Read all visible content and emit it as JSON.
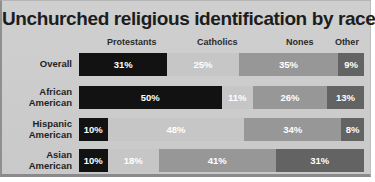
{
  "chart_data": {
    "type": "bar",
    "orientation": "horizontal-stacked",
    "title": "Unchurched religious identification by race",
    "xlabel": "",
    "ylabel": "",
    "xlim": [
      0,
      100
    ],
    "grid": false,
    "legend_position": "top",
    "value_suffix": "%",
    "categories": [
      "Overall",
      "African American",
      "Hispanic American",
      "Asian American"
    ],
    "series": [
      {
        "name": "Protestants",
        "color": "#121212",
        "values": [
          31,
          50,
          10,
          10
        ]
      },
      {
        "name": "Catholics",
        "color": "#c6c6c6",
        "values": [
          25,
          11,
          48,
          18
        ]
      },
      {
        "name": "Nones",
        "color": "#979797",
        "values": [
          35,
          26,
          34,
          41
        ]
      },
      {
        "name": "Other",
        "color": "#636363",
        "values": [
          9,
          13,
          8,
          31
        ]
      }
    ],
    "headers": [
      {
        "label": "Protestants",
        "left_pct": 3,
        "width_pct": 31
      },
      {
        "label": "Catholics",
        "left_pct": 36,
        "width_pct": 25
      },
      {
        "label": "Nones",
        "left_pct": 65,
        "width_pct": 25
      },
      {
        "label": "Other",
        "left_pct": 88,
        "width_pct": 12
      }
    ],
    "rows": [
      {
        "label_lines": [
          "Overall"
        ],
        "segments": [
          {
            "series": "Protestants",
            "value": 31,
            "text": "31%"
          },
          {
            "series": "Catholics",
            "value": 25,
            "text": "25%"
          },
          {
            "series": "Nones",
            "value": 35,
            "text": "35%"
          },
          {
            "series": "Other",
            "value": 9,
            "text": "9%"
          }
        ]
      },
      {
        "label_lines": [
          "African",
          "American"
        ],
        "segments": [
          {
            "series": "Protestants",
            "value": 50,
            "text": "50%"
          },
          {
            "series": "Catholics",
            "value": 11,
            "text": "11%"
          },
          {
            "series": "Nones",
            "value": 26,
            "text": "26%"
          },
          {
            "series": "Other",
            "value": 13,
            "text": "13%"
          }
        ]
      },
      {
        "label_lines": [
          "Hispanic",
          "American"
        ],
        "segments": [
          {
            "series": "Protestants",
            "value": 10,
            "text": "10%"
          },
          {
            "series": "Catholics",
            "value": 48,
            "text": "48%"
          },
          {
            "series": "Nones",
            "value": 34,
            "text": "34%"
          },
          {
            "series": "Other",
            "value": 8,
            "text": "8%"
          }
        ]
      },
      {
        "label_lines": [
          "Asian",
          "American"
        ],
        "segments": [
          {
            "series": "Protestants",
            "value": 10,
            "text": "10%"
          },
          {
            "series": "Catholics",
            "value": 18,
            "text": "18%"
          },
          {
            "series": "Nones",
            "value": 41,
            "text": "41%"
          },
          {
            "series": "Other",
            "value": 31,
            "text": "31%"
          }
        ]
      }
    ]
  }
}
